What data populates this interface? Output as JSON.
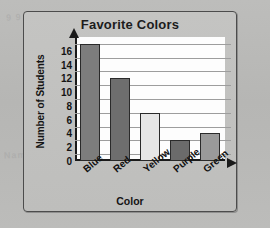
{
  "frame": {
    "ghost_text_1": "9 9 1",
    "ghost_text_2": "Name"
  },
  "chart_data": {
    "type": "bar",
    "title": "Favorite Colors",
    "xlabel": "Color",
    "ylabel": "Number of Students",
    "categories": [
      "Blue",
      "Red",
      "Yellow",
      "Purple",
      "Green"
    ],
    "values": [
      17,
      12,
      7,
      3,
      4
    ],
    "bar_colors": [
      "#7d7d7d",
      "#6e6e6e",
      "#e6e6e6",
      "#6b6b6b",
      "#9a9a9a"
    ],
    "ylim": [
      0,
      18
    ],
    "ytick_labels": [
      "0",
      "2",
      "4",
      "6",
      "8",
      "10",
      "12",
      "14",
      "16"
    ],
    "ytick_values": [
      0,
      2,
      4,
      6,
      8,
      10,
      12,
      14,
      16
    ],
    "gridline_values": [
      1,
      3,
      5,
      7,
      9,
      11,
      13,
      15,
      17
    ],
    "grid": true,
    "legend": "none",
    "axis_arrows": true
  }
}
